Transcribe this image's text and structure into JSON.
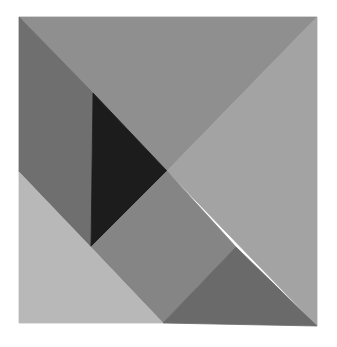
{
  "image": {
    "description": "Tangram square assembled from seven paper pieces in grayscale tones",
    "width": 337,
    "height": 347,
    "background": "#ffffff"
  },
  "pieces": [
    {
      "name": "large-triangle-top",
      "points": "19,17 317,17 167,171",
      "fill": "#8f8f8f"
    },
    {
      "name": "large-triangle-right",
      "points": "317,17 317,326 167,171",
      "fill": "#a3a3a3"
    },
    {
      "name": "parallelogram-left",
      "points": "19,17 93,93 91,247 19,172",
      "fill": "#6f6f6f"
    },
    {
      "name": "small-triangle-black",
      "points": "93,93 167,171 91,247",
      "fill": "#1c1c1c"
    },
    {
      "name": "square-middle",
      "points": "167,171 236,247 163,323 91,247",
      "fill": "#858585"
    },
    {
      "name": "medium-triangle-bottom-left",
      "points": "19,172 163,323 19,323",
      "fill": "#b8b8b8"
    },
    {
      "name": "small-triangle-bottom-right",
      "points": "236,247 317,326 163,323",
      "fill": "#6a6a6a"
    }
  ]
}
